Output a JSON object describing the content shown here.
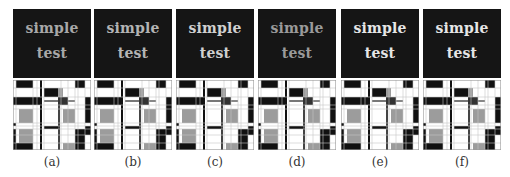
{
  "figure": {
    "panels": [
      {
        "id": "a",
        "caption": "(a)",
        "line1": "simple",
        "line2": "test",
        "text_color": "#a8a8a8",
        "left": 13
      },
      {
        "id": "b",
        "caption": "(b)",
        "line1": "simple",
        "line2": "test",
        "text_color": "#b4b4b4",
        "left": 94
      },
      {
        "id": "c",
        "caption": "(c)",
        "line1": "simple",
        "line2": "test",
        "text_color": "#d0d0d0",
        "left": 176
      },
      {
        "id": "d",
        "caption": "(d)",
        "line1": "simple",
        "line2": "test",
        "text_color": "#9a9a9a",
        "left": 258
      },
      {
        "id": "e",
        "caption": "(e)",
        "line1": "simple",
        "line2": "test",
        "text_color": "#e6e6e6",
        "left": 341
      },
      {
        "id": "f",
        "caption": "(f)",
        "line1": "simple",
        "line2": "test",
        "text_color": "#e6e6e6",
        "left": 423
      }
    ],
    "colors": {
      "dark_bg": "#151515",
      "black": "#111111",
      "grey": "#9c9c9c",
      "white": "#ffffff",
      "line": "#c8c8c8"
    }
  }
}
